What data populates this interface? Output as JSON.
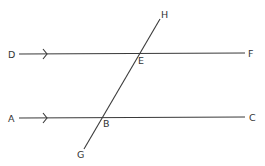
{
  "diagram": {
    "type": "parallel lines cut by a transversal",
    "line_color": "#3a3a3a",
    "label_color": "#333333",
    "labels": {
      "D": "D",
      "E": "E",
      "F": "F",
      "A": "A",
      "B": "B",
      "C": "C",
      "G": "G",
      "H": "H"
    },
    "lines": [
      {
        "name": "DF",
        "from": "D",
        "to": "F",
        "through": "E",
        "parallel_arrow": true
      },
      {
        "name": "AC",
        "from": "A",
        "to": "C",
        "through": "B",
        "parallel_arrow": true
      },
      {
        "name": "GH",
        "from": "G",
        "to": "H",
        "through": [
          "B",
          "E"
        ],
        "role": "transversal"
      }
    ],
    "points": {
      "D": [
        12,
        54
      ],
      "E": [
        140,
        53
      ],
      "F": [
        251,
        53
      ],
      "A": [
        12,
        118
      ],
      "B": [
        101,
        117
      ],
      "C": [
        252,
        117
      ],
      "G": [
        80,
        155
      ],
      "H": [
        164,
        14
      ]
    }
  }
}
